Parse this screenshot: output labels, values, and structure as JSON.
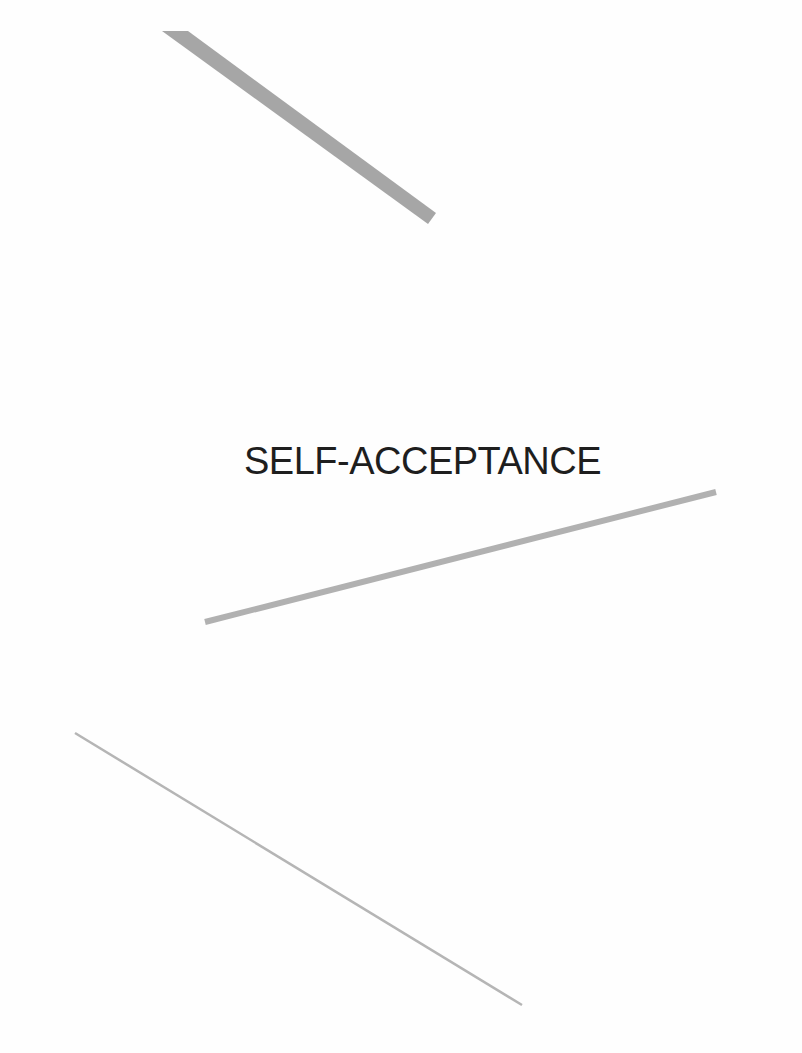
{
  "page": {
    "title": "SELF-ACCEPTANCE",
    "background": "#fefefe",
    "text_color": "#1e1e1e"
  },
  "decorations": {
    "top_band": {
      "points": "162,31 188,31 436,213 428,224",
      "color": "#a6a6a6"
    },
    "middle_line": {
      "x1": 205,
      "y1": 622,
      "x2": 716,
      "y2": 492,
      "width": 6,
      "color": "#b1b1b1"
    },
    "bottom_line": {
      "x1": 75,
      "y1": 733,
      "x2": 522,
      "y2": 1005,
      "width": 2.5,
      "color": "#b5b5b5"
    }
  }
}
